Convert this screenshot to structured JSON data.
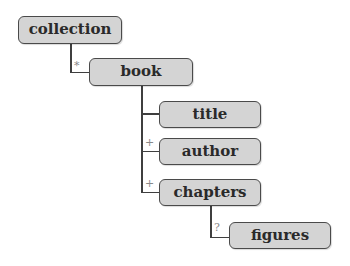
{
  "diagram": {
    "type": "tree",
    "nodes": [
      {
        "id": "collection",
        "label": "collection"
      },
      {
        "id": "book",
        "label": "book",
        "parent": "collection",
        "cardinality": "*"
      },
      {
        "id": "title",
        "label": "title",
        "parent": "book",
        "cardinality": ""
      },
      {
        "id": "author",
        "label": "author",
        "parent": "book",
        "cardinality": "+"
      },
      {
        "id": "chapters",
        "label": "chapters",
        "parent": "book",
        "cardinality": "+"
      },
      {
        "id": "figures",
        "label": "figures",
        "parent": "chapters",
        "cardinality": "?"
      }
    ],
    "cardinality": {
      "book": "*",
      "author": "+",
      "chapters": "+",
      "figures": "?"
    },
    "colors": {
      "node_fill": "#d4d4d4",
      "node_border": "#4a4a4a",
      "line": "#3f3f3f",
      "marker": "#888888"
    }
  }
}
